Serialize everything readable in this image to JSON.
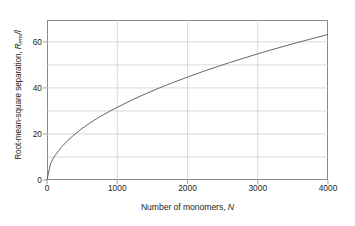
{
  "chart_data": {
    "type": "line",
    "title": "",
    "xlabel": "Number of monomers, N",
    "xlabel_plain": "Number of monomers,",
    "xlabel_symbol": "N",
    "ylabel": "Root-mean-square separation, R_rms/l",
    "ylabel_plain_lead": "Root-mean-square separation,",
    "ylabel_symbol": "R",
    "ylabel_subscript": "rms",
    "ylabel_tail": "/l",
    "xlim": [
      0,
      4000
    ],
    "ylim": [
      0,
      69.5
    ],
    "xticks": [
      0,
      1000,
      2000,
      3000,
      4000
    ],
    "xtick_labels": [
      "0",
      "1000",
      "2000",
      "3000",
      "4000"
    ],
    "yticks": [
      0,
      20,
      40,
      60
    ],
    "ytick_labels": [
      "0",
      "20",
      "40",
      "60"
    ],
    "y_minor_gridlines": [
      10,
      20,
      30,
      40,
      50,
      60
    ],
    "x_gridlines": [
      1000,
      2000,
      3000
    ],
    "grid": true,
    "legend": "none",
    "curve_color": "#55565a",
    "grid_color": "#c9c9c9",
    "frame_color": "#8a8a8a",
    "background": "#ffffff",
    "relation": "R_rms/l = sqrt(N)",
    "x": [
      0,
      50,
      100,
      200,
      300,
      400,
      500,
      600,
      700,
      800,
      900,
      1000,
      1200,
      1400,
      1600,
      1800,
      2000,
      2200,
      2400,
      2600,
      2800,
      3000,
      3200,
      3400,
      3600,
      3800,
      4000
    ],
    "values": [
      0,
      7.1,
      10.0,
      14.1,
      17.3,
      20.0,
      22.4,
      24.5,
      26.5,
      28.3,
      30.0,
      31.6,
      34.6,
      37.4,
      40.0,
      42.4,
      44.7,
      46.9,
      49.0,
      51.0,
      52.9,
      54.8,
      56.6,
      58.3,
      60.0,
      61.6,
      63.2
    ]
  }
}
